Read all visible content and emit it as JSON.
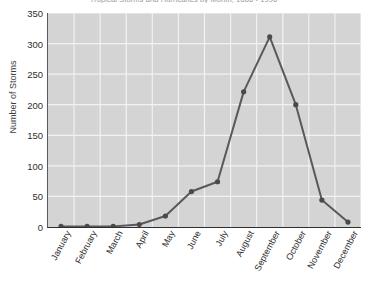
{
  "chart_data": {
    "type": "line",
    "title": "Tropical Storms and Hurricanes by Month, 1886 - 1996",
    "xlabel": "",
    "ylabel": "Number of Storms",
    "categories": [
      "January",
      "February",
      "March",
      "April",
      "May",
      "June",
      "July",
      "August",
      "September",
      "October",
      "November",
      "December"
    ],
    "values": [
      1,
      1,
      1,
      4,
      18,
      58,
      74,
      221,
      311,
      200,
      44,
      8
    ],
    "ylim": [
      0,
      350
    ],
    "yticks": [
      0,
      50,
      100,
      150,
      200,
      250,
      300,
      350
    ],
    "ytick_labels": [
      "0",
      "50",
      "100",
      "150",
      "200",
      "250",
      "300",
      "350"
    ],
    "grid": true,
    "legend": "none",
    "marker": "circle",
    "colors": {
      "line": "#595959",
      "marker": "#4a4a4a",
      "plot_background": "#d4d4d4",
      "gridline": "#f2f2f2",
      "axis": "#2e2e2e",
      "text": "#2e2e2e",
      "title_text": "#9a9a9a"
    }
  }
}
